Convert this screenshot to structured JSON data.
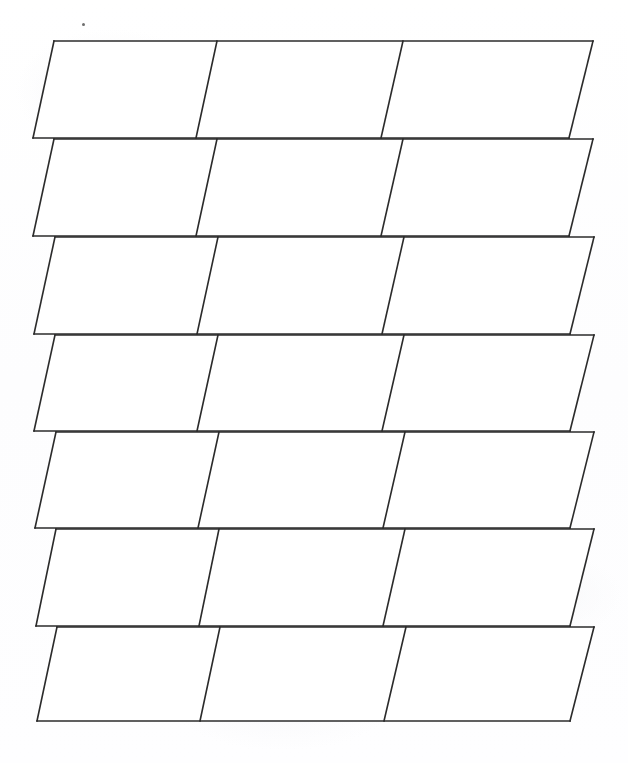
{
  "document": {
    "kind": "scanned-worksheet",
    "title": "Blank parallelogram grid",
    "description": "Hand-drawn blank grid of slanted rectangles (parallelograms) on white paper",
    "page_width": 628,
    "page_height": 763,
    "background_color": "#fefefe",
    "ink_color": "#2b2b2b",
    "line_width": 1.6,
    "cell_fill_color": "#ffffff"
  },
  "grid": {
    "row_count": 7,
    "columns_per_row": 3,
    "total_cells": 21,
    "slant_offset_px": 21,
    "rows": [
      {
        "index": 1,
        "top_y": 41,
        "bottom_y": 138,
        "top_left_x": 54,
        "top_right_x": 593,
        "bottom_left_x": 33,
        "bottom_right_x": 569,
        "divider_top_x": [
          217,
          403
        ],
        "divider_bottom_x": [
          196,
          381
        ]
      },
      {
        "index": 2,
        "top_y": 139,
        "bottom_y": 236,
        "top_left_x": 54,
        "top_right_x": 593,
        "bottom_left_x": 33,
        "bottom_right_x": 569,
        "divider_top_x": [
          217,
          403
        ],
        "divider_bottom_x": [
          196,
          381
        ]
      },
      {
        "index": 3,
        "top_y": 237,
        "bottom_y": 334,
        "top_left_x": 55,
        "top_right_x": 594,
        "bottom_left_x": 34,
        "bottom_right_x": 570,
        "divider_top_x": [
          218,
          404
        ],
        "divider_bottom_x": [
          197,
          382
        ]
      },
      {
        "index": 4,
        "top_y": 335,
        "bottom_y": 431,
        "top_left_x": 55,
        "top_right_x": 594,
        "bottom_left_x": 34,
        "bottom_right_x": 570,
        "divider_top_x": [
          218,
          404
        ],
        "divider_bottom_x": [
          197,
          382
        ]
      },
      {
        "index": 5,
        "top_y": 432,
        "bottom_y": 528,
        "top_left_x": 56,
        "top_right_x": 594,
        "bottom_left_x": 35,
        "bottom_right_x": 570,
        "divider_top_x": [
          219,
          405
        ],
        "divider_bottom_x": [
          198,
          383
        ]
      },
      {
        "index": 6,
        "top_y": 529,
        "bottom_y": 626,
        "top_left_x": 56,
        "top_right_x": 594,
        "bottom_left_x": 36,
        "bottom_right_x": 570,
        "divider_top_x": [
          219,
          405
        ],
        "divider_bottom_x": [
          199,
          383
        ]
      },
      {
        "index": 7,
        "top_y": 627,
        "bottom_y": 721,
        "top_left_x": 57,
        "top_right_x": 594,
        "bottom_left_x": 37,
        "bottom_right_x": 570,
        "divider_top_x": [
          220,
          406
        ],
        "divider_bottom_x": [
          200,
          384
        ]
      }
    ]
  },
  "artifacts": {
    "stray_mark": {
      "label": "stray pencil dot",
      "x": 82,
      "y": 23,
      "size": 3,
      "color": "#555555"
    }
  }
}
